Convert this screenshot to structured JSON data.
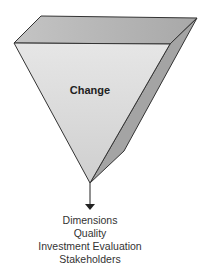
{
  "diagram": {
    "pyramid": {
      "label": "Change",
      "colors": {
        "front": "#dcdcdc",
        "top": "#b4b4b4",
        "side": "#a2a2a2",
        "stroke": "#333333"
      }
    },
    "arrow": {
      "direction": "down"
    },
    "outputs": [
      "Dimensions",
      "Quality",
      "Investment Evaluation",
      "Stakeholders"
    ]
  }
}
